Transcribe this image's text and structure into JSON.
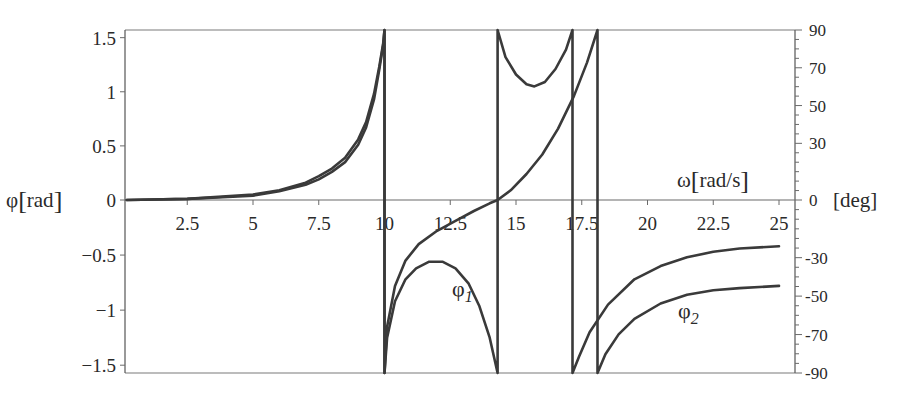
{
  "chart_data": {
    "type": "line",
    "title": "",
    "xlabel": "ω[rad/s]",
    "ylabel": "φ[rad]",
    "y2label": "[deg]",
    "xlim": [
      0.2,
      25.5
    ],
    "ylim": [
      -1.5708,
      1.5708
    ],
    "y2lim": [
      -90,
      90
    ],
    "grid": false,
    "legend": "inline curve labels",
    "x_ticks": [
      "2.5",
      "5",
      "7.5",
      "10",
      "12.5",
      "15",
      "17.5",
      "20",
      "22.5",
      "25"
    ],
    "x_tick_values": [
      2.5,
      5,
      7.5,
      10,
      12.5,
      15,
      17.5,
      20,
      22.5,
      25
    ],
    "y_ticks": [
      "1.5",
      "1",
      "0.5",
      "0",
      "−0.5",
      "−1",
      "−1.5"
    ],
    "y_tick_values": [
      1.5,
      1,
      0.5,
      0,
      -0.5,
      -1,
      -1.5
    ],
    "y2_ticks": [
      "90",
      "70",
      "50",
      "30",
      "0",
      "-30",
      "-50",
      "-70",
      "-90"
    ],
    "y2_tick_values": [
      90,
      70,
      50,
      30,
      0,
      -30,
      -50,
      -70,
      -90
    ],
    "series": [
      {
        "name": "φ1",
        "label_main": "φ",
        "label_sub": "1",
        "description": "Phase angle 1; jumps at ω≈10, ≈14.3, ≈17.1",
        "x": [
          0.2,
          2.5,
          5,
          6,
          7,
          7.5,
          8,
          8.5,
          9,
          9.3,
          9.6,
          9.8,
          9.95,
          10.0,
          10.0,
          10.1,
          10.4,
          10.8,
          11.2,
          11.7,
          12.2,
          12.7,
          13.2,
          13.6,
          14.0,
          14.3,
          14.3,
          14.6,
          15.0,
          15.4,
          15.7,
          16.1,
          16.5,
          16.9,
          17.15,
          17.15,
          17.4,
          17.8,
          18.5,
          19.5,
          20.5,
          21.5,
          22.5,
          23.5,
          25.0
        ],
        "y": [
          0.0,
          0.01,
          0.05,
          0.09,
          0.16,
          0.22,
          0.29,
          0.39,
          0.56,
          0.72,
          0.98,
          1.23,
          1.45,
          1.5708,
          -1.5708,
          -1.25,
          -0.92,
          -0.72,
          -0.62,
          -0.56,
          -0.56,
          -0.62,
          -0.76,
          -0.96,
          -1.25,
          -1.5708,
          1.5708,
          1.32,
          1.16,
          1.07,
          1.05,
          1.09,
          1.21,
          1.39,
          1.5708,
          -1.5708,
          -1.42,
          -1.2,
          -0.95,
          -0.72,
          -0.6,
          -0.52,
          -0.47,
          -0.44,
          -0.42
        ]
      },
      {
        "name": "φ2",
        "label_main": "φ",
        "label_sub": "2",
        "description": "Phase angle 2; jumps at ω≈10, ≈18.1",
        "x": [
          0.2,
          2.5,
          5,
          6,
          7,
          7.5,
          8,
          8.5,
          9,
          9.3,
          9.6,
          9.8,
          9.95,
          10.0,
          10.0,
          10.1,
          10.4,
          10.8,
          11.3,
          12.0,
          12.7,
          13.4,
          14.0,
          14.3,
          14.8,
          15.4,
          16.0,
          16.6,
          17.2,
          17.7,
          18.1,
          18.1,
          18.4,
          18.9,
          19.5,
          20.5,
          21.5,
          22.5,
          23.5,
          25.0
        ],
        "y": [
          0.0,
          0.01,
          0.04,
          0.08,
          0.14,
          0.19,
          0.26,
          0.35,
          0.51,
          0.67,
          0.93,
          1.2,
          1.43,
          1.5708,
          -1.5708,
          -1.15,
          -0.78,
          -0.55,
          -0.4,
          -0.28,
          -0.19,
          -0.1,
          -0.03,
          0.0,
          0.09,
          0.24,
          0.42,
          0.66,
          0.96,
          1.27,
          1.5708,
          -1.5708,
          -1.4,
          -1.22,
          -1.08,
          -0.94,
          -0.86,
          -0.82,
          -0.8,
          -0.78
        ]
      }
    ]
  },
  "axes": {
    "left_label_main": "φ",
    "left_label_unit": "rad",
    "x_label_main": "ω",
    "x_label_unit": "rad/s",
    "right_label": "[deg]"
  },
  "colors": {
    "curve": "#3a3a3a",
    "frame": "#555555",
    "text": "#2a2a2a",
    "background": "#ffffff"
  }
}
